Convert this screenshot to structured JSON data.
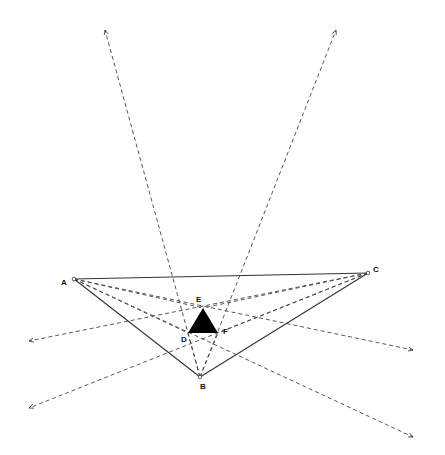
{
  "diagram": {
    "points": {
      "A": {
        "label": "A",
        "x": 74,
        "y": 279
      },
      "B": {
        "label": "B",
        "x": 200,
        "y": 377
      },
      "C": {
        "label": "C",
        "x": 368,
        "y": 273
      },
      "D": {
        "label": "D",
        "x": 188,
        "y": 333
      },
      "E": {
        "label": "E",
        "x": 203,
        "y": 308
      },
      "F": {
        "label": "F",
        "x": 218,
        "y": 333
      }
    },
    "label_positions": {
      "A": {
        "x": 61,
        "y": 285
      },
      "B": {
        "x": 200,
        "y": 389
      },
      "C": {
        "x": 373,
        "y": 272
      },
      "D": {
        "x": 181,
        "y": 342
      },
      "E": {
        "x": 196,
        "y": 302
      },
      "F": {
        "x": 223,
        "y": 334
      }
    },
    "triangle_edges": [
      [
        "A",
        "B"
      ],
      [
        "B",
        "C"
      ],
      [
        "C",
        "A"
      ]
    ],
    "morley_triangle": {
      "vertices": [
        "D",
        "E",
        "F"
      ],
      "fill": "#000000"
    },
    "trisector_rays": [
      {
        "from": "B",
        "to": {
          "x": 105,
          "y": 30
        }
      },
      {
        "from": "B",
        "to": {
          "x": 336,
          "y": 30
        }
      },
      {
        "from": "C",
        "to": {
          "x": 29,
          "y": 341
        }
      },
      {
        "from": "C",
        "to": {
          "x": 29,
          "y": 408
        }
      },
      {
        "from": "A",
        "to": {
          "x": 413,
          "y": 350
        }
      },
      {
        "from": "A",
        "to": {
          "x": 413,
          "y": 437
        }
      }
    ],
    "colors": {
      "line": "#333333",
      "dash": "#444444",
      "fill": "#000000"
    }
  }
}
